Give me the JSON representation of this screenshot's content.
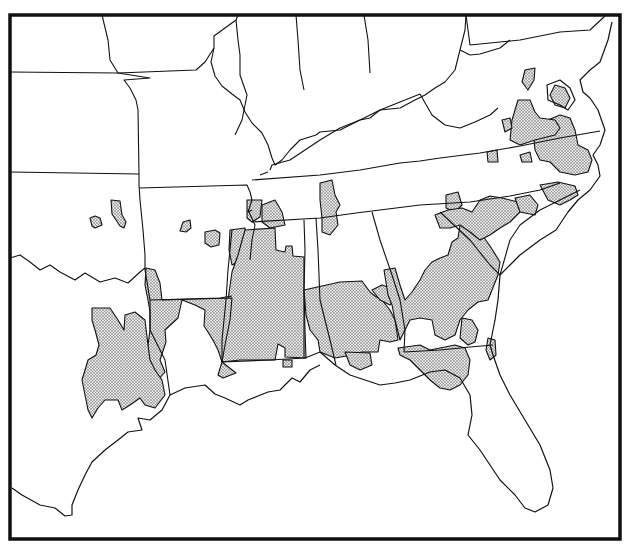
{
  "map": {
    "frame": {
      "x": 10,
      "y": 15,
      "width": 610,
      "height": 524
    },
    "colors": {
      "background": "#ffffff",
      "line": "#111111",
      "stipple_bg": "#e6e6e6",
      "stipple_dot": "#555555"
    },
    "legend": null,
    "title": null,
    "state_boundaries": [
      "M10,72 L118,73",
      "M102,15 L108,40 L110,60 L118,73 L196,70 L205,62 L214,48 L214,36 L236,20 L238,15",
      "M118,73 L150,78 L124,80 L130,88 L136,100 L138,110 L139,175",
      "M10,172 L139,174",
      "M139,175 L139,185 L140,200 L143,230 L145,255",
      "M139,188 L247,185 L250,192 L252,200 L248,212 L252,210",
      "M214,48 L211,62 L215,76 L222,86 L232,94 L240,100 L245,112 L252,123 L262,133 L268,145 L272,158 L275,165 L282,160 L290,150 L300,140 L316,135",
      "M236,20 L238,40 L240,55 L240,75 L247,95 L242,120 L235,135",
      "M296,15 L298,40 L300,70 L304,90",
      "M364,15 L368,40 L370,73",
      "M270,170 L272,165 L290,160 L320,140 L340,128 L360,120 L370,118 L380,110 L400,108 L415,100 L425,95 L435,88 L445,82 L455,70 L460,50 L465,30 L466,15",
      "M316,135 L320,132 L340,130 L380,110 L400,102 L420,94",
      "M252,180 L320,175 L360,170 L400,163 L420,161 L440,158 L480,153 L520,146 L560,138 L600,131",
      "M420,94 L432,115 L445,125 L460,128 L475,122 L490,115 L498,108",
      "M260,175 L268,172",
      "M466,15 L470,45 L520,40 L560,32 L590,30 L605,16",
      "M460,50 L470,55 L480,54 L500,48 L510,40",
      "M250,260 L252,240 L255,225 L248,210",
      "M252,222 L320,218 L356,213 L380,210 L420,205 L470,202 L510,196 L540,190 L560,183",
      "M316,218 L318,250 L320,300 L330,340 L336,365",
      "M372,212 L380,240 L392,275 L400,300 L405,330 L404,352",
      "M404,352 L440,350 L470,347 L493,345",
      "M440,212 L470,240 L490,265 L500,275",
      "M500,275 L510,240 L520,225 L540,210 L560,200 L580,190",
      "M145,255 L145,270 L150,300 L150,330 L165,360 L170,395",
      "M150,300 L220,298 L232,296",
      "M232,230 L228,270 L226,300 L222,340 L222,362",
      "M222,362 L270,360 L305,358 L320,352",
      "M304,358 L304,290 L305,250 L304,220",
      "M10,258 L20,255 L30,262 L40,270 L50,265 L60,272 L75,280 L85,273 L100,282 L115,278 L128,283 L140,272 L145,268"
    ],
    "coastline": [
      "M170,395 L162,410 L150,420 L138,418 L142,430 L128,432 L118,440 L105,450 L92,462 L85,475 L78,490 L72,505 L72,515 L65,516 L55,508 L40,505 L22,495 L12,488",
      "M170,395 L185,388 L205,385 L215,394 L225,398 L240,405 L248,400 L268,392 L280,390 L292,378 L300,382 L310,370 L320,365",
      "M320,352 L335,365 L350,375 L365,380 L380,385 L395,383 L410,380 L430,372 L445,370 L460,378 L470,395 L472,415 L468,435 L480,450 L490,465 L500,480 L515,495 L525,508 L535,512 L548,505 L553,488 L550,470 L540,445 L525,420 L510,395 L500,375 L493,355 L490,345",
      "M490,345 L495,320 L498,300 L500,275",
      "M500,275 L510,265 L520,255 L540,240 L556,230 L568,212 L578,200 L590,190 L600,176 L598,165 L593,155 L600,145 L605,130 L598,110 L590,98 L583,92 L580,80 L590,70 L600,62 L608,40 L612,22",
      "M547,85 L560,80 L570,88 L575,100 L568,110 L560,105 L548,100 Z"
    ],
    "shaded_regions": [
      "M90,218 L95,216 L100,218 L102,225 L95,228 L92,226 Z",
      "M111,200 L120,201 L122,215 L126,222 L124,228 L120,226 L116,220 L112,214 Z",
      "M183,222 L190,220 L191,228 L186,232 L180,231 Z",
      "M205,232 L215,230 L220,233 L219,245 L211,247 L205,243 Z",
      "M230,230 L245,228 L247,240 L238,262 L232,265 L229,250 Z",
      "M247,200 L262,200 L260,217 L252,222 L247,218 Z",
      "M262,205 L275,200 L282,212 L285,225 L270,228 L262,222 Z",
      "M245,230 L275,228 L276,250 L285,252 L286,246 L292,246 L293,256 L304,257 L304,290 L305,330 L306,358 L285,357 L285,348 L278,344 L275,360 L240,360 L222,362 L225,330 L228,300 L232,272 L238,255 Z",
      "M146,268 L155,270 L160,283 L162,300 L232,298 L230,320 L225,345 L222,362 L218,375 L223,378 L236,373 L222,362 L218,350 L214,342 L208,332 L204,326 L205,310 L195,305 L182,300 L178,318 L165,330 L166,342 L160,360 L165,372 L158,380 L150,383 L148,360 L148,345 L150,330 L150,312 L148,300 L145,285 Z",
      "M92,308 L110,308 L118,320 L124,330 L125,315 L135,312 L145,320 L148,345 L150,360 L155,370 L162,380 L165,395 L155,408 L145,405 L140,398 L130,405 L122,410 L118,400 L105,400 L98,408 L92,418 L88,410 L85,395 L82,380 L88,360 L96,355 L99,345 L95,330 L92,320 Z",
      "M304,290 L340,282 L362,281 L370,292 L375,296 L382,300 L390,310 L395,320 L398,340 L390,342 L380,340 L378,352 L362,352 L352,355 L335,358 L320,352 L318,340 L310,330 L306,315 Z",
      "M372,290 L382,285 L390,288 L395,298 L390,305 L380,300 Z",
      "M384,270 L395,268 L400,285 L405,300 L412,292 L420,280 L425,270 L432,262 L440,258 L448,255 L452,242 L458,238 L460,225 L470,222 L480,232 L490,246 L500,262 L498,275 L492,290 L488,300 L478,302 L468,310 L460,320 L455,335 L445,340 L435,335 L432,320 L420,318 L410,320 L405,330 L400,340 L395,320 L392,305 L388,295 Z",
      "M398,348 L420,345 L430,350 L440,348 L455,345 L465,348 L470,360 L468,375 L460,385 L450,390 L440,388 L430,380 L420,370 L410,360 L400,355 Z",
      "M345,352 L370,353 L372,365 L360,370 L350,365 Z",
      "M462,318 L472,320 L478,330 L475,342 L468,345 L460,338 Z",
      "M488,338 L495,340 L496,355 L490,360 L486,350 Z",
      "M320,183 L332,180 L335,195 L340,205 L336,212 L338,225 L330,235 L322,232 L322,218 L320,200 Z",
      "M446,195 L458,192 L462,205 L455,212 L446,208 Z",
      "M435,215 L448,210 L462,208 L472,212 L480,200 L490,196 L502,198 L518,202 L520,212 L510,222 L500,228 L490,235 L480,240 L470,232 L460,225 L450,228 L440,228 Z",
      "M515,198 L530,195 L538,205 L535,215 L520,212 Z",
      "M540,185 L558,182 L575,186 L578,195 L570,200 L560,205 L548,200 Z",
      "M520,155 L530,152 L532,162 L522,162 Z",
      "M487,152 L497,150 L498,162 L488,162 Z",
      "M533,130 L548,120 L560,115 L570,118 L575,130 L578,145 L588,150 L592,160 L588,172 L575,175 L560,172 L550,162 L540,160 L535,150 Z",
      "M518,100 L530,100 L535,112 L540,118 L555,120 L560,128 L555,135 L535,140 L520,145 L510,140 L512,120 L515,110 Z",
      "M502,120 L510,118 L512,128 L505,132 Z",
      "M525,70 L535,68 L534,80 L528,90 L522,82 Z",
      "M555,85 L565,88 L570,98 L565,108 L555,105 L550,95 Z",
      "M283,360 L292,360 L292,367 L283,367 Z"
    ]
  }
}
